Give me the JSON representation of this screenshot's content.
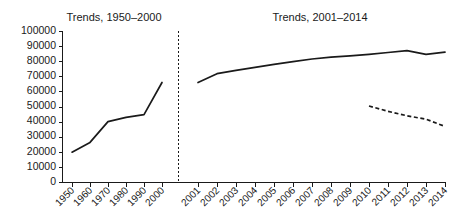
{
  "chart_data": {
    "type": "line",
    "title": "",
    "xlabel": "",
    "ylabel": "",
    "ylim": [
      0,
      100000
    ],
    "grid": false,
    "legend": "none",
    "panels": [
      {
        "name": "left-panel",
        "title": "Trends, 1950–2000",
        "categories": [
          "1950",
          "1960",
          "1970",
          "1980",
          "1990",
          "2000"
        ],
        "series": [
          {
            "name": "trend-1950-2000",
            "style": "solid",
            "values": [
              20000,
              26500,
              40200,
              43000,
              44800,
              66000
            ]
          }
        ]
      },
      {
        "name": "right-panel",
        "title": "Trends, 2001–2014",
        "categories": [
          "2001",
          "2002",
          "2003",
          "2004",
          "2005",
          "2006",
          "2007",
          "2008",
          "2009",
          "2010",
          "2011",
          "2012",
          "2013",
          "2014"
        ],
        "series": [
          {
            "name": "trend-2001-2014-solid",
            "style": "solid",
            "values": [
              66000,
              71800,
              74000,
              76000,
              78000,
              79800,
              81500,
              82800,
              83600,
              84600,
              85800,
              87000,
              84600,
              86000
            ]
          },
          {
            "name": "trend-2010-2014-dashed",
            "style": "dashed",
            "values": [
              null,
              null,
              null,
              null,
              null,
              null,
              null,
              null,
              null,
              50500,
              47000,
              44000,
              41800,
              37000
            ]
          }
        ]
      }
    ],
    "yticks": [
      "0",
      "10000",
      "20000",
      "30000",
      "40000",
      "50000",
      "60000",
      "70000",
      "80000",
      "90000",
      "100000"
    ],
    "ytick_values": [
      0,
      10000,
      20000,
      30000,
      40000,
      50000,
      60000,
      70000,
      80000,
      90000,
      100000
    ],
    "divider": {
      "name": "panel-divider",
      "style": "dashed"
    },
    "colors": {
      "line": "#1a1a1a",
      "axis": "#1a1a1a",
      "background": "#ffffff"
    }
  }
}
